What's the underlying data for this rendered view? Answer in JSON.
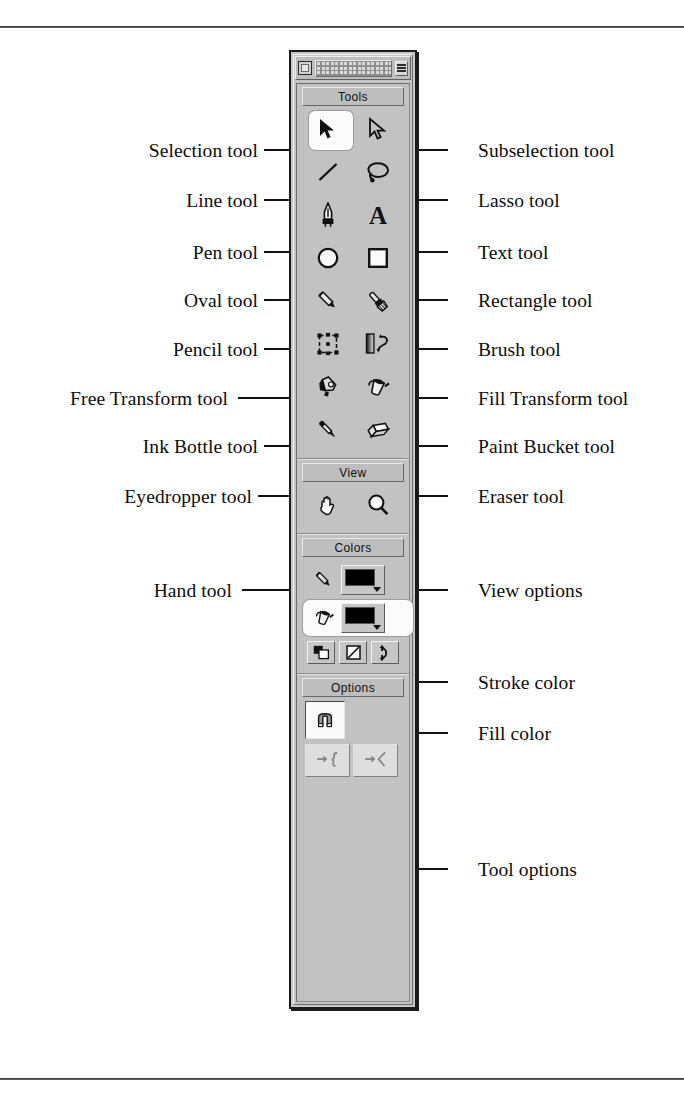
{
  "page": {
    "figure_kind": "annotated-diagram",
    "rules": [
      "top",
      "bottom"
    ]
  },
  "window": {
    "titlebar": {
      "close_label": "",
      "grip_label": "",
      "menu_label": ""
    }
  },
  "sections": [
    {
      "id": "tools",
      "header": "Tools"
    },
    {
      "id": "view",
      "header": "View"
    },
    {
      "id": "colors",
      "header": "Colors"
    },
    {
      "id": "options",
      "header": "Options"
    }
  ],
  "tools": [
    {
      "icon": "arrow-selection-icon",
      "name": "Selection tool",
      "selected": true
    },
    {
      "icon": "arrow-subselection-icon",
      "name": "Subselection tool",
      "selected": false
    },
    {
      "icon": "line-icon",
      "name": "Line tool",
      "selected": false
    },
    {
      "icon": "lasso-icon",
      "name": "Lasso tool",
      "selected": false
    },
    {
      "icon": "pen-nib-icon",
      "name": "Pen tool",
      "selected": false
    },
    {
      "icon": "text-a-icon",
      "name": "Text tool",
      "selected": false
    },
    {
      "icon": "oval-icon",
      "name": "Oval tool",
      "selected": false
    },
    {
      "icon": "rectangle-icon",
      "name": "Rectangle tool",
      "selected": false
    },
    {
      "icon": "pencil-icon",
      "name": "Pencil tool",
      "selected": false
    },
    {
      "icon": "brush-icon",
      "name": "Brush tool",
      "selected": false
    },
    {
      "icon": "free-transform-icon",
      "name": "Free Transform tool",
      "selected": false
    },
    {
      "icon": "fill-transform-icon",
      "name": "Fill Transform tool",
      "selected": false
    },
    {
      "icon": "ink-bottle-icon",
      "name": "Ink Bottle tool",
      "selected": false
    },
    {
      "icon": "paint-bucket-icon",
      "name": "Paint Bucket tool",
      "selected": false
    },
    {
      "icon": "eyedropper-icon",
      "name": "Eyedropper tool",
      "selected": false
    },
    {
      "icon": "eraser-icon",
      "name": "Eraser tool",
      "selected": false
    }
  ],
  "view_tools": [
    {
      "icon": "hand-icon",
      "name": "Hand tool"
    },
    {
      "icon": "magnifier-icon",
      "name": "View options"
    }
  ],
  "colors": {
    "stroke": {
      "icon": "pencil-icon",
      "name": "Stroke color",
      "value": "#000000",
      "selected": false
    },
    "fill": {
      "icon": "paint-bucket-icon",
      "name": "Fill color",
      "value": "#000000",
      "selected": true
    },
    "mini_buttons": [
      {
        "icon": "default-colors-icon",
        "name": "Default colors"
      },
      {
        "icon": "no-color-icon",
        "name": "No color"
      },
      {
        "icon": "swap-colors-icon",
        "name": "Swap colors"
      }
    ]
  },
  "options": {
    "main": {
      "icon": "magnet-snap-icon",
      "name": "Snap to objects",
      "active": true
    },
    "extra": [
      {
        "icon": "smooth-curve-icon",
        "name": "Smooth",
        "enabled": false
      },
      {
        "icon": "straighten-curve-icon",
        "name": "Straighten",
        "enabled": false
      }
    ]
  },
  "callouts": {
    "left": [
      {
        "label": "Selection tool"
      },
      {
        "label": "Line tool"
      },
      {
        "label": "Pen tool"
      },
      {
        "label": "Oval tool"
      },
      {
        "label": "Pencil tool"
      },
      {
        "label": "Free Transform tool"
      },
      {
        "label": "Ink Bottle tool"
      },
      {
        "label": "Eyedropper tool"
      },
      {
        "label": "Hand tool"
      }
    ],
    "right": [
      {
        "label": "Subselection tool"
      },
      {
        "label": "Lasso tool"
      },
      {
        "label": "Text tool"
      },
      {
        "label": "Rectangle tool"
      },
      {
        "label": "Brush tool"
      },
      {
        "label": "Fill Transform tool"
      },
      {
        "label": "Paint Bucket tool"
      },
      {
        "label": "Eraser tool"
      },
      {
        "label": "View options"
      },
      {
        "label": "Stroke color"
      },
      {
        "label": "Fill color"
      },
      {
        "label": "Tool options"
      }
    ]
  }
}
